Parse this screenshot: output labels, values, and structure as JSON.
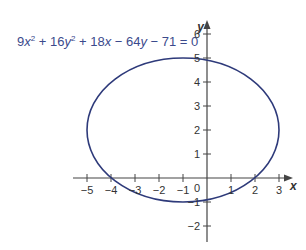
{
  "equation": {
    "parts": [
      {
        "text": "9"
      },
      {
        "text": "x",
        "italic": true
      },
      {
        "text": "2",
        "sup": true
      },
      {
        "text": " + 16"
      },
      {
        "text": "y",
        "italic": true
      },
      {
        "text": "2",
        "sup": true
      },
      {
        "text": " + 18"
      },
      {
        "text": "x",
        "italic": true
      },
      {
        "text": " − 64"
      },
      {
        "text": "y",
        "italic": true
      },
      {
        "text": " − 71 = 0"
      }
    ],
    "full_text": "9x² + 16y² + 18x − 64y − 71 = 0",
    "color": "#3b4a8c"
  },
  "axes": {
    "x_label": "x",
    "y_label": "y",
    "x_ticks": [
      -5,
      -4,
      -3,
      -2,
      -1,
      0,
      1,
      2,
      3
    ],
    "y_ticks": [
      -2,
      -1,
      1,
      2,
      3,
      4,
      5,
      6
    ],
    "origin_label": "0",
    "color": "#444444"
  },
  "ellipse": {
    "center": [
      -1,
      2
    ],
    "rx": 4,
    "ry": 3,
    "color": "#2e3a7a"
  },
  "layout": {
    "origin_px": [
      207,
      178
    ],
    "unit_px_x": 24,
    "unit_px_y": 24,
    "x_axis_range_px": [
      73,
      293
    ],
    "y_axis_range_px": [
      242,
      20
    ]
  }
}
